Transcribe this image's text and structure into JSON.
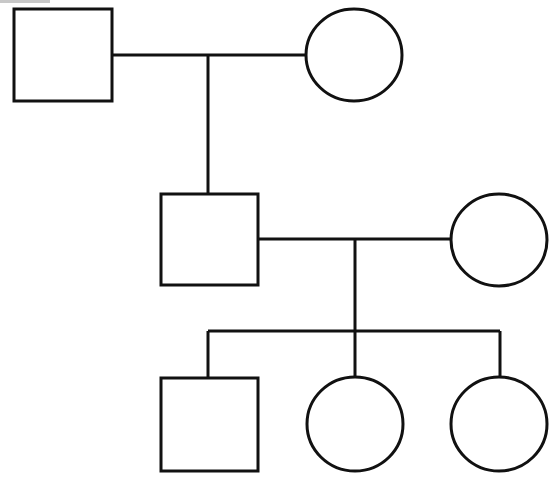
{
  "diagram": {
    "type": "pedigree",
    "stroke_color": "#111111",
    "background_color": "#ffffff",
    "generations": [
      {
        "id": "I",
        "individuals": [
          {
            "id": "I-1",
            "sex": "male",
            "shape": "square",
            "affected": false
          },
          {
            "id": "I-2",
            "sex": "female",
            "shape": "circle",
            "affected": false
          }
        ]
      },
      {
        "id": "II",
        "individuals": [
          {
            "id": "II-1",
            "sex": "male",
            "shape": "square",
            "affected": false,
            "parents": [
              "I-1",
              "I-2"
            ]
          },
          {
            "id": "II-2",
            "sex": "female",
            "shape": "circle",
            "affected": false
          }
        ]
      },
      {
        "id": "III",
        "individuals": [
          {
            "id": "III-1",
            "sex": "male",
            "shape": "square",
            "affected": false,
            "parents": [
              "II-1",
              "II-2"
            ]
          },
          {
            "id": "III-2",
            "sex": "female",
            "shape": "circle",
            "affected": false,
            "parents": [
              "II-1",
              "II-2"
            ]
          },
          {
            "id": "III-3",
            "sex": "female",
            "shape": "circle",
            "affected": false,
            "parents": [
              "II-1",
              "II-2"
            ]
          }
        ]
      }
    ],
    "matings": [
      {
        "partners": [
          "I-1",
          "I-2"
        ],
        "children": [
          "II-1"
        ]
      },
      {
        "partners": [
          "II-1",
          "II-2"
        ],
        "children": [
          "III-1",
          "III-2",
          "III-3"
        ]
      }
    ]
  }
}
